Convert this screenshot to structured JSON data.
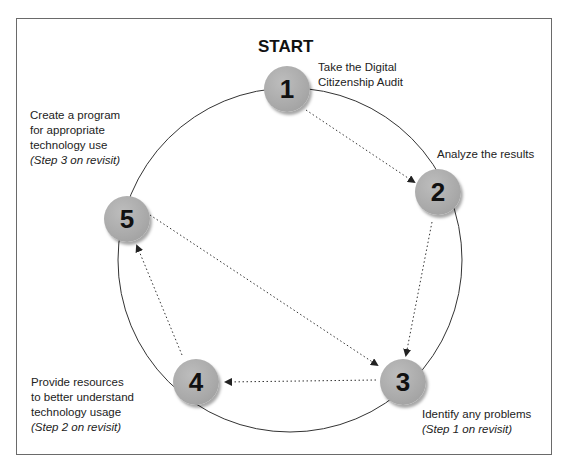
{
  "title": "START",
  "steps": [
    {
      "number": "1",
      "line1": "Take the Digital",
      "line2": "Citizenship Audit"
    },
    {
      "number": "2",
      "line1": "Analyze the results"
    },
    {
      "number": "3",
      "line1": "Identify any problems",
      "note": "(Step 1 on revisit)"
    },
    {
      "number": "4",
      "line1": "Provide resources",
      "line2": "to better understand",
      "line3": "technology usage",
      "note": "(Step 2 on revisit)"
    },
    {
      "number": "5",
      "line1": "Create a program",
      "line2": "for appropriate",
      "line3": "technology use",
      "note": "(Step 3 on revisit)"
    }
  ],
  "arrows": [
    {
      "from": "1",
      "to": "2",
      "style": "dotted"
    },
    {
      "from": "2",
      "to": "3",
      "style": "dotted"
    },
    {
      "from": "3",
      "to": "4",
      "style": "dotted"
    },
    {
      "from": "4",
      "to": "5",
      "style": "dotted"
    },
    {
      "from": "5",
      "to": "3",
      "style": "dotted"
    }
  ],
  "colors": {
    "node_fill": "#a9a9a9",
    "line": "#333333"
  }
}
